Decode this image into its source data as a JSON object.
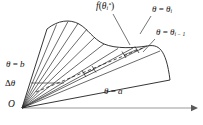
{
  "figure": {
    "background_color": "#ffffff",
    "line_color": "#1a1a1a",
    "axis_color": "#888888",
    "width": 203,
    "height": 125
  },
  "labels": {
    "f_theta_star": "f(θᵢ*)",
    "f_theta_star_parts": {
      "fn": "f",
      "open": "(",
      "theta": "θ",
      "sub": "i",
      "sup": "*",
      "close": ")"
    },
    "theta_i": "θ = θᵢ",
    "theta_i_parts": {
      "theta": "θ",
      "eq": " = ",
      "theta2": "θ",
      "sub": "i"
    },
    "theta_i_minus_1": "θ = θᵢ₋₁",
    "theta_i_minus_1_parts": {
      "theta": "θ",
      "eq": " = ",
      "theta2": "θ",
      "sub": "i − 1"
    },
    "theta_b": "θ = b",
    "theta_b_parts": {
      "theta": "θ",
      "eq": " = ",
      "value": "b"
    },
    "delta_theta": "Δθ",
    "delta_theta_parts": {
      "delta": "Δ",
      "theta": "θ"
    },
    "theta_a": "θ = a",
    "theta_a_parts": {
      "theta": "θ",
      "eq": " = ",
      "value": "a"
    },
    "origin": "O"
  },
  "geometry": {
    "origin_point": {
      "x": 22,
      "y": 108
    },
    "polar_axis": {
      "x1": 22,
      "y1": 108,
      "x2": 196,
      "y2": 108,
      "arrow": true
    },
    "ray_theta_b_end": {
      "x": 47,
      "y": 29
    },
    "ray_theta_a_end": {
      "x": 170,
      "y": 80
    },
    "sector_count": 10,
    "highlighted_sector_index": 8,
    "midray_style": "dashed",
    "boundary_curve": "wavy curve r = f(theta) from theta = b to theta = a"
  },
  "icons": {
    "arrow_head": "axis-arrow-icon",
    "leader_line": "leader-line-icon"
  }
}
